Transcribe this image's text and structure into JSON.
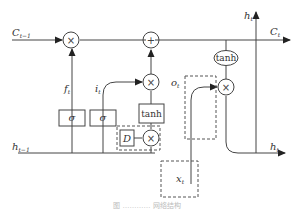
{
  "diagram": {
    "type": "LSTM cell variant",
    "inputs": {
      "c_prev": "C",
      "c_prev_sub": "t−1",
      "h_prev": "h",
      "h_prev_sub": "t−1",
      "x": "x",
      "x_sub": "t"
    },
    "outputs": {
      "c": "C",
      "c_sub": "t",
      "h_top": "h",
      "h_top_sub": "t",
      "h_right": "h",
      "h_right_sub": "t"
    },
    "gates": {
      "forget": "f",
      "forget_sub": "t",
      "input": "i",
      "input_sub": "t",
      "output": "o",
      "output_sub": "t"
    },
    "blocks": {
      "sigma1": "σ",
      "sigma2": "σ",
      "tanh_box": "tanh",
      "tanh_ellipse": "tanh",
      "delay": "D"
    },
    "operators": {
      "multiply": "×",
      "add": "+"
    },
    "caption": "图 ………… 网络结构"
  }
}
